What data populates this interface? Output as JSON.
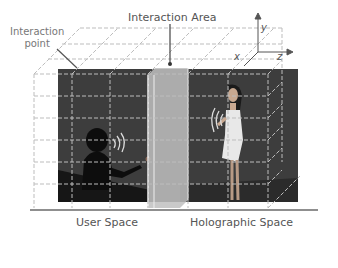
{
  "figure": {
    "labels": {
      "interaction_area": "Interaction Area",
      "interaction_point_line1": "Interaction",
      "interaction_point_line2": "point",
      "user_space": "User Space",
      "holographic_space": "Holographic Space"
    },
    "axes": {
      "y": "y",
      "x": "x",
      "z": "z"
    },
    "colors": {
      "background": "#ffffff",
      "scene_dark": "#3a3a3a",
      "grid": "#c8c8c8",
      "panel": "#b8b8b8",
      "text": "#555555"
    }
  }
}
